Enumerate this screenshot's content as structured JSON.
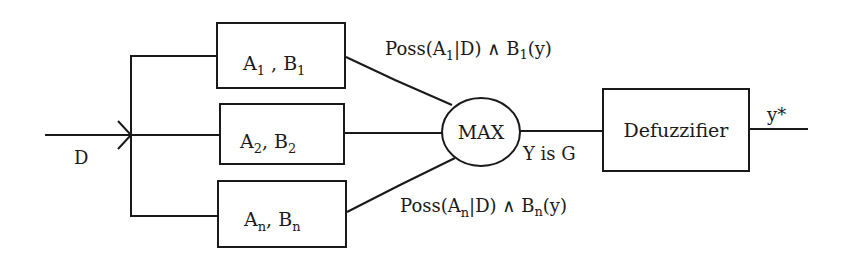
{
  "diagram": {
    "input": {
      "label": "D"
    },
    "rule_blocks": [
      {
        "a": "A",
        "a_sub": "1",
        "sep": " , ",
        "b": "B",
        "b_sub": "1"
      },
      {
        "a": "A",
        "a_sub": "2",
        "sep": ", ",
        "b": "B",
        "b_sub": "2"
      },
      {
        "a": "A",
        "a_sub": "n",
        "sep": ", ",
        "b": "B",
        "b_sub": "n"
      }
    ],
    "edge_labels": {
      "top": {
        "prefix": "Poss(A",
        "sub1": "1",
        "mid": "|D) ∧ B",
        "sub2": "1",
        "suffix": "(y)"
      },
      "bottom": {
        "prefix": "Poss(A",
        "sub1": "n",
        "mid": "|D) ∧ B",
        "sub2": "n",
        "suffix": "(y)"
      }
    },
    "aggregator": {
      "label": "MAX",
      "output_label": "Y is G"
    },
    "defuzzifier": {
      "label": "Defuzzifier"
    },
    "output": {
      "label": "y*"
    },
    "colors": {
      "stroke": "#1a1a1a",
      "background": "#ffffff"
    }
  }
}
